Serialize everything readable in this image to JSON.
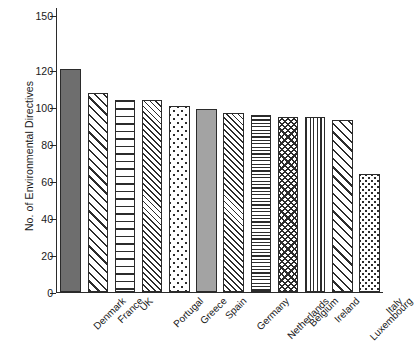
{
  "chart_data": {
    "type": "bar",
    "title": "",
    "xlabel": "",
    "ylabel": "No. of Environmental Directives",
    "ylim": [
      0,
      150
    ],
    "grid": false,
    "legend": "none",
    "ytick_labels": [
      "0",
      "20",
      "40",
      "60",
      "80",
      "100",
      "120",
      "150"
    ],
    "ytick_values": [
      0,
      20,
      40,
      60,
      80,
      100,
      120,
      150
    ],
    "categories": [
      "Denmark",
      "France",
      "UK",
      "Portugal",
      "Greece",
      "Spain",
      "Germany",
      "Netherlands",
      "Belgium",
      "Ireland",
      "Luxembourg",
      "Italy"
    ],
    "values": [
      121,
      108,
      104,
      104,
      101,
      99,
      97,
      96,
      95,
      95,
      93,
      64
    ],
    "bar_patterns": [
      "solid-dark-gray",
      "diagonal-hatch",
      "horizontal-lines",
      "diagonal-hatch-fine",
      "dots",
      "solid-medium-gray",
      "diagonal-hatch-fine",
      "horizontal-lines-fine",
      "checkerboard",
      "vertical-lines",
      "diagonal-hatch",
      "dots-fine"
    ]
  },
  "colors": {
    "axis": "#2b2b2b",
    "bar_outline": "#2b2b2b",
    "solid_dark": "#6e6e6e",
    "solid_mid": "#a3a3a3",
    "background": "#ffffff"
  }
}
